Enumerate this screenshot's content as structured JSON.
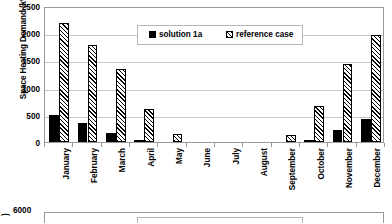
{
  "chart_data": {
    "type": "bar",
    "title": "",
    "xlabel": "",
    "ylabel": "Space Heating Demand (kWh)",
    "ylim": [
      0,
      2500
    ],
    "ytick_step": 500,
    "yticks": [
      2500,
      2000,
      1500,
      1000,
      500,
      0
    ],
    "ytick_labels": [
      "2500",
      "2000",
      "1500",
      "1000",
      "500",
      "0"
    ],
    "grid": "horizontal",
    "legend_position": "upper center",
    "categories": [
      "January",
      "February",
      "March",
      "April",
      "May",
      "June",
      "July",
      "August",
      "September",
      "October",
      "November",
      "December"
    ],
    "series": [
      {
        "name": "solution 1a",
        "fill": "solid-black",
        "color": "#000000",
        "values": [
          500,
          345,
          160,
          20,
          0,
          0,
          0,
          0,
          0,
          10,
          225,
          420
        ]
      },
      {
        "name": "reference case",
        "fill": "diagonal-hatch",
        "color": "#000000",
        "values": [
          2180,
          1790,
          1340,
          615,
          145,
          0,
          0,
          0,
          125,
          655,
          1430,
          1960
        ]
      }
    ]
  },
  "chart_2": {
    "ylabel_fragment": ")",
    "ytick_label": "6000"
  }
}
